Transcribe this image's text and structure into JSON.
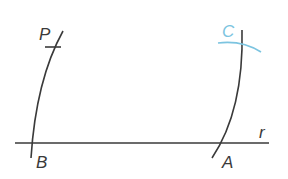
{
  "diagram": {
    "line_label": "r",
    "points": {
      "P": "P",
      "B": "B",
      "A": "A",
      "C": "C"
    },
    "colors": {
      "ink": "#3a3a3a",
      "highlight": "#7cc4e0"
    }
  }
}
